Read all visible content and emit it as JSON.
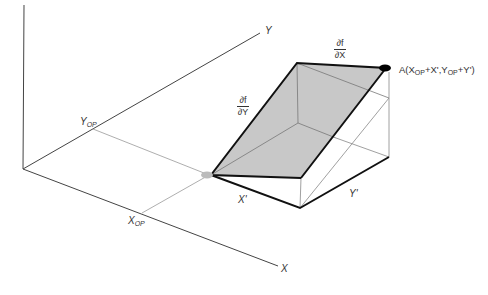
{
  "diagram": {
    "axes": {
      "x_label": "X",
      "y_label": "Y"
    },
    "operating_point": {
      "x_label": "X",
      "x_sub": "OP",
      "y_label": "Y",
      "y_sub": "OP"
    },
    "increments": {
      "x_label": "X'",
      "y_label": "Y'"
    },
    "partials": {
      "df_dx": {
        "num": "∂f",
        "den": "∂X"
      },
      "df_dy": {
        "num": "∂f",
        "den": "∂Y"
      }
    },
    "point_a": {
      "prefix": "A(X",
      "sub1": "OP",
      "mid": "+X',Y",
      "sub2": "OP",
      "suffix": "+Y')"
    },
    "colors": {
      "axis": "#444444",
      "thick_edge": "#111111",
      "thin_edge": "#888888",
      "shaded_plane": "#c8c8c8",
      "point_a_fill": "#000000",
      "point_op_fill": "#bbbbbb"
    }
  }
}
